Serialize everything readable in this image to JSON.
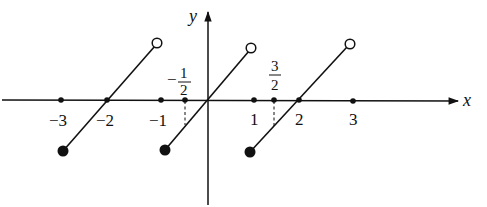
{
  "figure": {
    "axes": {
      "x_label": "x",
      "y_label": "y"
    },
    "x_ticks": [
      {
        "value": -3,
        "label": "−3"
      },
      {
        "value": -2,
        "label": "−2"
      },
      {
        "value": -1,
        "label": "−1"
      },
      {
        "value": -0.5,
        "label_num": "1",
        "label_den": "2",
        "label_sign": "−"
      },
      {
        "value": 1,
        "label": "1"
      },
      {
        "value": 1.5,
        "label_num": "3",
        "label_den": "2",
        "label_sign": ""
      },
      {
        "value": 2,
        "label": "2"
      },
      {
        "value": 3,
        "label": "3"
      }
    ],
    "segments": [
      {
        "x_start": -3,
        "x_end": -1,
        "start": "filled",
        "end": "open"
      },
      {
        "x_start": -1,
        "x_end": 1,
        "start": "filled",
        "end": "open"
      },
      {
        "x_start": 1,
        "x_end": 3,
        "start": "filled",
        "end": "open"
      }
    ],
    "dashed_guides": [
      -0.5,
      1.5
    ],
    "colors": {
      "ink": "#111111",
      "background": "#ffffff"
    }
  }
}
